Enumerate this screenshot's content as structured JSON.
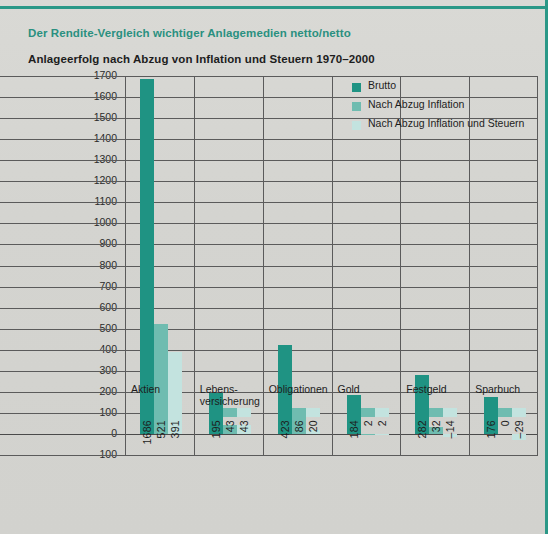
{
  "header": {
    "eyebrow": "Der Rendite-Vergleich wichtiger Anlagemedien netto/netto",
    "title": "Anlageerfolg nach Abzug von Inflation und Steuern 1970–2000"
  },
  "colors": {
    "accent": "#2a9887",
    "series_1": "#1f9383",
    "series_2": "#6fbcb0",
    "series_3": "#c3e3df",
    "paper": "#d6d6d2",
    "grid": "#5b5b5b"
  },
  "chart_data": {
    "type": "bar",
    "title": "Anlageerfolg nach Abzug von Inflation und Steuern 1970–2000",
    "subtitle": "Der Rendite-Vergleich wichtiger Anlagemedien netto/netto",
    "xlabel": "",
    "ylabel": "",
    "ylim": [
      -100,
      1700
    ],
    "ytick_step": 100,
    "yticks": [
      1700,
      1600,
      1500,
      1400,
      1300,
      1200,
      1100,
      1000,
      900,
      800,
      700,
      600,
      500,
      400,
      300,
      200,
      100,
      0,
      -100
    ],
    "ytick_labels": [
      "1700",
      "1600",
      "1500",
      "1400",
      "1300",
      "1200",
      "1100",
      "1000",
      "900",
      "800",
      "700",
      "600",
      "500",
      "400",
      "300",
      "200",
      "100",
      "0",
      "–100"
    ],
    "grid": true,
    "legend_position": "top-right",
    "categories": [
      "Aktien",
      "Lebens-\nversicherung",
      "Obligationen",
      "Gold",
      "Festgeld",
      "Sparbuch"
    ],
    "category_labels": [
      [
        "Aktien"
      ],
      [
        "Lebens-",
        "versicherung"
      ],
      [
        "Obligationen"
      ],
      [
        "Gold"
      ],
      [
        "Festgeld"
      ],
      [
        "Sparbuch"
      ]
    ],
    "series": [
      {
        "name": "Brutto",
        "color": "#1f9383",
        "values": [
          1686,
          195,
          423,
          184,
          282,
          176
        ]
      },
      {
        "name": "Nach Abzug Inflation",
        "color": "#6fbcb0",
        "values": [
          521,
          43,
          86,
          2,
          32,
          0
        ]
      },
      {
        "name": "Nach Abzug Inflation und Steuern",
        "color": "#c3e3df",
        "values": [
          391,
          43,
          20,
          2,
          -14,
          -29
        ]
      }
    ],
    "value_labels": [
      [
        "1686",
        "521",
        "391"
      ],
      [
        "195",
        "43",
        "43"
      ],
      [
        "423",
        "86",
        "20"
      ],
      [
        "184",
        "2",
        "2"
      ],
      [
        "282",
        "32",
        "–14"
      ],
      [
        "176",
        "0",
        "–29"
      ]
    ]
  }
}
